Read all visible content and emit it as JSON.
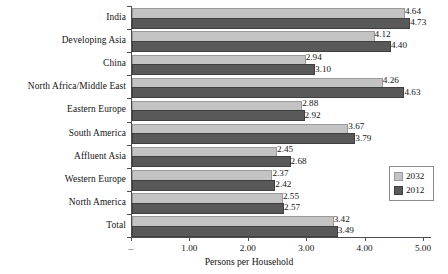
{
  "chart_data": {
    "type": "bar",
    "orientation": "horizontal",
    "title": "",
    "xlabel": "Persons per Household",
    "ylabel": "",
    "xlim": [
      0,
      5
    ],
    "xticks": [
      "–",
      "1.00",
      "2.00",
      "3.00",
      "4.00",
      "5.00"
    ],
    "xtick_values": [
      0,
      1,
      2,
      3,
      4,
      5
    ],
    "grid": false,
    "legend_position": "right-middle",
    "categories": [
      "India",
      "Developing Asia",
      "China",
      "North Africa/Middle East",
      "Eastern Europe",
      "South America",
      "Affluent Asia",
      "Western Europe",
      "North America",
      "Total"
    ],
    "series": [
      {
        "name": "2032",
        "color": "#c3c3c3",
        "values": [
          4.64,
          4.12,
          2.94,
          4.26,
          2.88,
          3.67,
          2.45,
          2.37,
          2.55,
          3.42
        ],
        "labels": [
          "4.64",
          "4.12",
          "2.94",
          "4.26",
          "2.88",
          "3.67",
          "2.45",
          "2.37",
          "2.55",
          "3.42"
        ]
      },
      {
        "name": "2012",
        "color": "#595959",
        "values": [
          4.73,
          4.4,
          3.1,
          4.63,
          2.92,
          3.79,
          2.68,
          2.42,
          2.57,
          3.49
        ],
        "labels": [
          "4.73",
          "4.40",
          "3.10",
          "4.63",
          "2.92",
          "3.79",
          "2.68",
          "2.42",
          "2.57",
          "3.49"
        ]
      }
    ]
  },
  "legend": {
    "items": [
      {
        "label": "2032",
        "swatch": "s2032"
      },
      {
        "label": "2012",
        "swatch": "s2012"
      }
    ]
  },
  "axis": {
    "x_title": "Persons per Household"
  }
}
